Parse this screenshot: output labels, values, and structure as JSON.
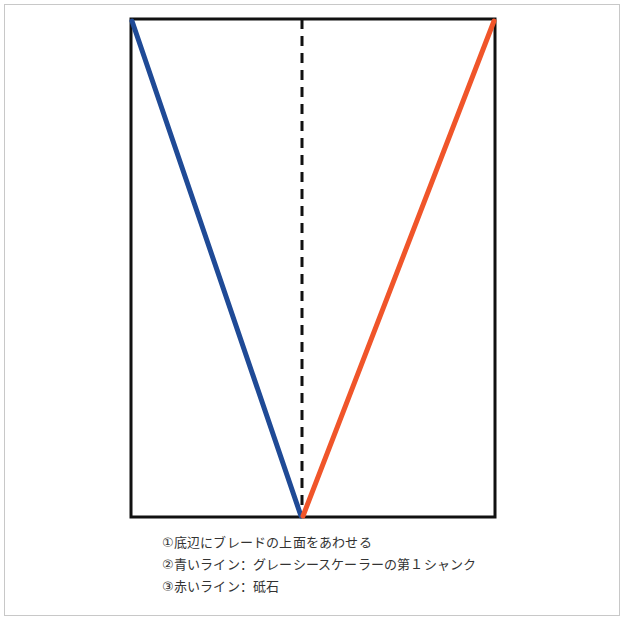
{
  "diagram": {
    "type": "blade-angle-guide",
    "colors": {
      "frame": "#111111",
      "blue_line": "#1f4a96",
      "red_line": "#f0552a",
      "center_dash": "#111111"
    },
    "rectangle": {
      "left": 131,
      "top": 19,
      "right": 495,
      "bottom": 517
    },
    "apex": {
      "x": 302,
      "y": 517
    },
    "center_line": {
      "x": 302,
      "style": "dashed"
    }
  },
  "captions": [
    "①底辺にブレードの上面をあわせる",
    "②青いライン：グレーシースケーラーの第１シャンク",
    "③赤いライン：砥石"
  ]
}
